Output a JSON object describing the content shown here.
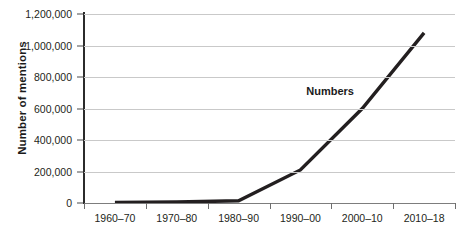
{
  "chart_data": {
    "type": "line",
    "title": "",
    "xlabel": "",
    "ylabel": "Number of mentions",
    "categories": [
      "1960–70",
      "1970–80",
      "1980–90",
      "1990–00",
      "2000–10",
      "2010–18"
    ],
    "series": [
      {
        "name": "Numbers",
        "values": [
          4000,
          6000,
          14000,
          210000,
          600000,
          1080000
        ]
      }
    ],
    "ylim": [
      0,
      1200000
    ],
    "yticks": [
      0,
      200000,
      400000,
      600000,
      800000,
      1000000,
      1200000
    ],
    "ytick_labels": [
      "0",
      "200,000",
      "400,000",
      "600,000",
      "800,000",
      "1,000,000",
      "1,200,000"
    ],
    "grid": true,
    "legend": false,
    "annotations": [
      {
        "text": "Numbers",
        "category_index": 4,
        "value": 700000
      }
    ],
    "colors": {
      "series_line": "#231f20",
      "gridline": "#c9c9c9",
      "axis": "#2b2b2b",
      "background": "#ffffff",
      "text": "#231f20"
    }
  }
}
